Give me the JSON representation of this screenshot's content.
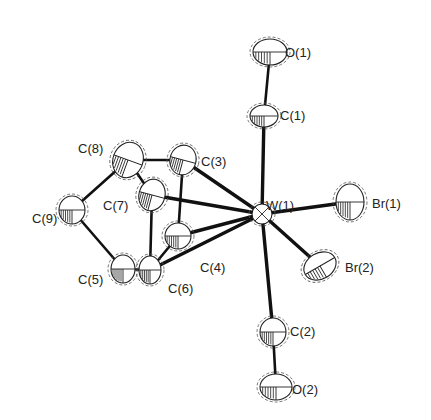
{
  "figure": {
    "type": "ORTEP molecular structure",
    "atoms": [
      {
        "id": "O1",
        "label": "O(1)"
      },
      {
        "id": "C1",
        "label": "C(1)"
      },
      {
        "id": "W1",
        "label": "W(1)"
      },
      {
        "id": "Br1",
        "label": "Br(1)"
      },
      {
        "id": "Br2",
        "label": "Br(2)"
      },
      {
        "id": "C2",
        "label": "C(2)"
      },
      {
        "id": "O2",
        "label": "O(2)"
      },
      {
        "id": "C3",
        "label": "C(3)"
      },
      {
        "id": "C4",
        "label": "C(4)"
      },
      {
        "id": "C5",
        "label": "C(5)"
      },
      {
        "id": "C6",
        "label": "C(6)"
      },
      {
        "id": "C7",
        "label": "C(7)"
      },
      {
        "id": "C8",
        "label": "C(8)"
      },
      {
        "id": "C9",
        "label": "C(9)"
      }
    ],
    "bonds": [
      [
        "O1",
        "C1"
      ],
      [
        "C1",
        "W1"
      ],
      [
        "W1",
        "C2"
      ],
      [
        "C2",
        "O2"
      ],
      [
        "W1",
        "Br1"
      ],
      [
        "W1",
        "Br2"
      ],
      [
        "W1",
        "C3"
      ],
      [
        "W1",
        "C7"
      ],
      [
        "W1",
        "C4"
      ],
      [
        "W1",
        "C6"
      ],
      [
        "C8",
        "C3"
      ],
      [
        "C8",
        "C7"
      ],
      [
        "C8",
        "C9"
      ],
      [
        "C9",
        "C5"
      ],
      [
        "C5",
        "C6"
      ],
      [
        "C7",
        "C6"
      ],
      [
        "C3",
        "C4"
      ],
      [
        "C4",
        "C6"
      ]
    ]
  }
}
